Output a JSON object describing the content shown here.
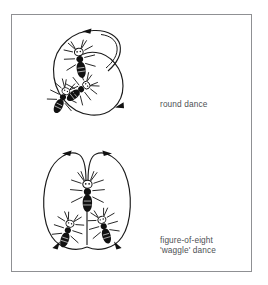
{
  "figure": {
    "background_color": "#ffffff",
    "border_color": "#8f9093",
    "ink_color": "#1b1b1b",
    "label_color": "#4e5154"
  },
  "panels": [
    {
      "id": "round-dance",
      "label": "round dance",
      "diagram_type": "spiral-loop",
      "bee_count": 3,
      "arrow_count": 2,
      "arrow_positions": [
        "top",
        "bottom-right"
      ],
      "description": "Single circular loop with inner spiral turn crossing near the top right; three bees drawn inside the loop."
    },
    {
      "id": "waggle-dance",
      "label_line_1": "figure-of-eight",
      "label_line_2": "'waggle' dance",
      "diagram_type": "figure-of-eight",
      "bee_count": 3,
      "arrow_count": 4,
      "arrow_positions": [
        "top-left",
        "top-right",
        "bottom-left",
        "bottom-right"
      ],
      "description": "Two tall adjacent loops meeting at a central vertical waggle run; three bees drawn along the central axis."
    }
  ],
  "labels": {
    "round_dance": "round dance",
    "waggle_dance_line_1": "figure-of-eight",
    "waggle_dance_line_2": "'waggle' dance"
  },
  "icon_names": [
    "bee-icon",
    "arrowhead-icon",
    "loop-path-icon"
  ]
}
